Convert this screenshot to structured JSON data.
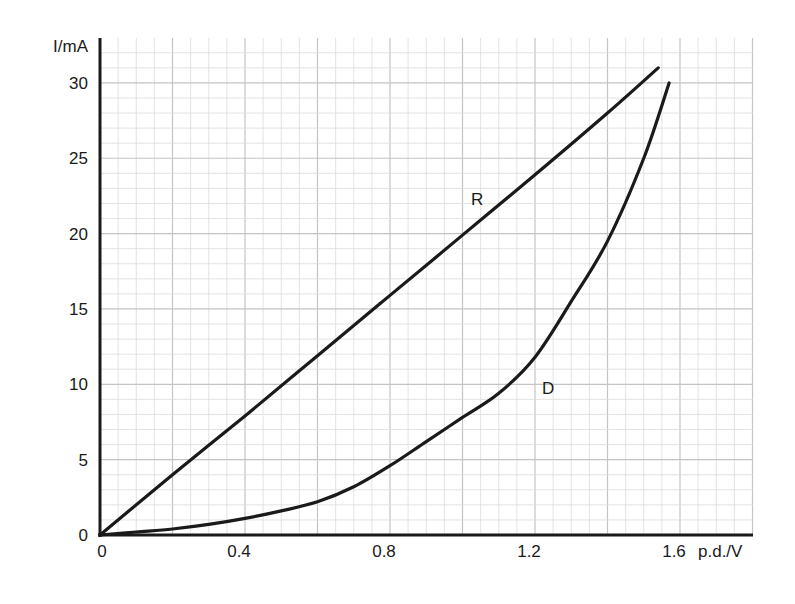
{
  "chart_data": {
    "type": "line",
    "title": "",
    "xlabel": "p.d./V",
    "ylabel": "I/mA",
    "xlim": [
      0,
      1.75
    ],
    "ylim": [
      0,
      32
    ],
    "x_ticks": [
      {
        "value": 0,
        "label": "0"
      },
      {
        "value": 0.4,
        "label": "0.4"
      },
      {
        "value": 0.8,
        "label": "0.8"
      },
      {
        "value": 1.2,
        "label": "1.2"
      },
      {
        "value": 1.6,
        "label": "1.6"
      }
    ],
    "y_ticks": [
      {
        "value": 0,
        "label": "0"
      },
      {
        "value": 5,
        "label": "5"
      },
      {
        "value": 10,
        "label": "10"
      },
      {
        "value": 15,
        "label": "15"
      },
      {
        "value": 20,
        "label": "20"
      },
      {
        "value": 25,
        "label": "25"
      },
      {
        "value": 30,
        "label": "30"
      }
    ],
    "grid": true,
    "legend": "none (curves labelled directly)",
    "series": [
      {
        "name": "R",
        "label_at": {
          "x": 1.04,
          "y": 22.5
        },
        "x": [
          0,
          0.2,
          0.4,
          0.6,
          0.8,
          1.0,
          1.2,
          1.4,
          1.54
        ],
        "y": [
          0,
          4.0,
          7.9,
          11.9,
          15.9,
          19.9,
          23.9,
          28.0,
          31.0
        ]
      },
      {
        "name": "D",
        "label_at": {
          "x": 1.22,
          "y": 9.8
        },
        "x": [
          0,
          0.1,
          0.2,
          0.3,
          0.4,
          0.5,
          0.6,
          0.7,
          0.8,
          0.9,
          1.0,
          1.1,
          1.2,
          1.3,
          1.4,
          1.5,
          1.57
        ],
        "y": [
          0,
          0.2,
          0.4,
          0.7,
          1.1,
          1.6,
          2.2,
          3.2,
          4.6,
          6.2,
          7.8,
          9.4,
          11.8,
          15.5,
          19.5,
          25.0,
          30.0
        ]
      }
    ]
  },
  "labels": {
    "y_axis_title": "I/mA",
    "x_axis_title": "p.d./V",
    "curve_r": "R",
    "curve_d": "D"
  },
  "colors": {
    "curve": "#1a1a1a",
    "axis": "#1a1a1a",
    "grid_minor": "#dcdcdc",
    "grid_major": "#c4c4c4",
    "background": "#ffffff"
  }
}
